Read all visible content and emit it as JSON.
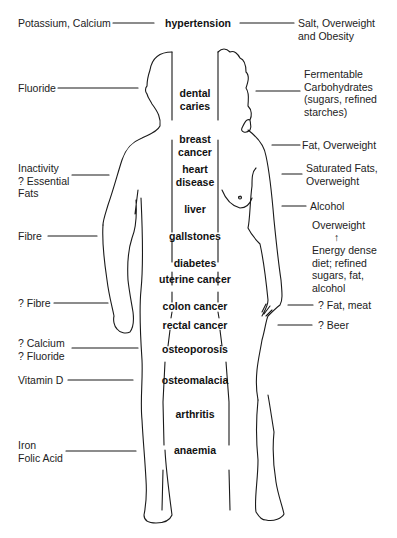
{
  "diagram": {
    "type": "annotated-body-outline",
    "center_title": "hypertension",
    "left_factors": [
      {
        "id": "potassium",
        "text": "Potassium, Calcium"
      },
      {
        "id": "fluoride",
        "text": "Fluoride"
      },
      {
        "id": "inactivity",
        "text": "Inactivity\n? Essential\nFats"
      },
      {
        "id": "fibre",
        "text": "Fibre"
      },
      {
        "id": "q-fibre",
        "text": "? Fibre"
      },
      {
        "id": "q-calcium",
        "text": "? Calcium\n? Fluoride"
      },
      {
        "id": "vitamin-d",
        "text": "Vitamin D"
      },
      {
        "id": "iron",
        "text": "Iron\nFolic Acid"
      }
    ],
    "right_factors": [
      {
        "id": "salt",
        "text": "Salt, Overweight\nand Obesity"
      },
      {
        "id": "fermentable",
        "text": "Fermentable\nCarbohydrates\n(sugars, refined\nstarches)"
      },
      {
        "id": "fat-overweight",
        "text": "Fat, Overweight"
      },
      {
        "id": "saturated",
        "text": "Saturated Fats,\nOverweight"
      },
      {
        "id": "alcohol",
        "text": "Alcohol"
      },
      {
        "id": "overweight",
        "text": "Overweight"
      },
      {
        "id": "arrow",
        "text": "↑"
      },
      {
        "id": "energy",
        "text": "Energy dense\ndiet; refined\nsugars, fat,\nalcohol"
      },
      {
        "id": "fat-meat",
        "text": "? Fat, meat"
      },
      {
        "id": "beer",
        "text": "? Beer"
      }
    ],
    "diseases": [
      {
        "id": "dental-caries",
        "text": "dental\ncaries"
      },
      {
        "id": "breast-cancer",
        "text": "breast\ncancer"
      },
      {
        "id": "heart-disease",
        "text": "heart\ndisease"
      },
      {
        "id": "liver",
        "text": "liver"
      },
      {
        "id": "gallstones",
        "text": "gallstones"
      },
      {
        "id": "diabetes",
        "text": "diabetes"
      },
      {
        "id": "uterine-cancer",
        "text": "uterine cancer"
      },
      {
        "id": "colon-cancer",
        "text": "colon cancer"
      },
      {
        "id": "rectal-cancer",
        "text": "rectal cancer"
      },
      {
        "id": "osteoporosis",
        "text": "osteoporosis"
      },
      {
        "id": "osteomalacia",
        "text": "osteomalacia"
      },
      {
        "id": "arthritis",
        "text": "arthritis"
      },
      {
        "id": "anaemia",
        "text": "anaemia"
      }
    ],
    "colors": {
      "line": "#1a1a1a",
      "background": "#ffffff"
    }
  }
}
